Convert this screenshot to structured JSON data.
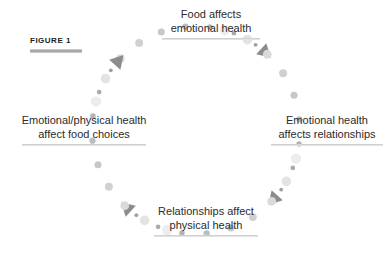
{
  "figure": {
    "tag": "FIGURE 1"
  },
  "nodes": {
    "top": {
      "line1": "Food affects",
      "line2": "emotional health"
    },
    "right": {
      "line1": "Emotional health",
      "line2": "affects relationships"
    },
    "bottom": {
      "line1": "Relationships affect",
      "line2": "physical health"
    },
    "left": {
      "line1": "Emotional/physical health",
      "line2": "affect food choices"
    }
  },
  "colors": {
    "background": "#ffffff",
    "text": "#2b2b2b",
    "tag_text": "#1c1c1c",
    "rule": "#d0d0d0",
    "tag_rule": "#a8a8a8",
    "arrow_head": "#8c8c8c",
    "dot_dark": "#a0a0a0",
    "dot_light": "#ededed"
  },
  "cycle_geometry": {
    "center_x": 196,
    "center_y": 130,
    "radius": 104,
    "direction": "clockwise",
    "arcs": [
      {
        "name": "left-to-top",
        "start_deg": 196,
        "end_deg": 305,
        "dots": 9,
        "arrow_deg": 312
      },
      {
        "name": "top-to-right",
        "start_deg": 286,
        "end_deg": 35,
        "dots": 9,
        "arrow_deg": 42
      },
      {
        "name": "right-to-bottom",
        "start_deg": 16,
        "end_deg": 125,
        "dots": 9,
        "arrow_deg": 132
      },
      {
        "name": "bottom-to-left",
        "start_deg": 106,
        "end_deg": 215,
        "dots": 9,
        "arrow_deg": 222
      }
    ]
  }
}
